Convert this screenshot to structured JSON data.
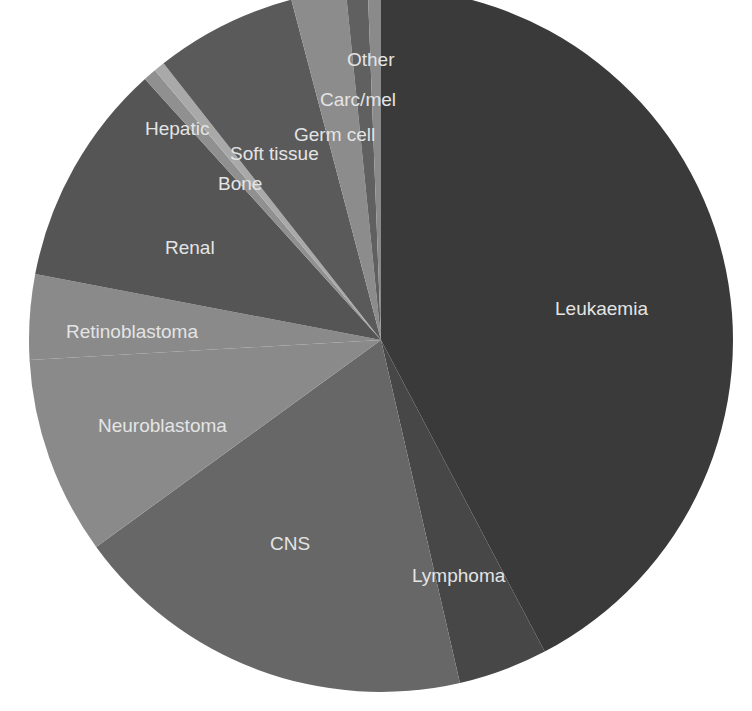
{
  "chart_data": {
    "type": "pie",
    "title": "",
    "start_angle_deg": 0,
    "direction": "clockwise",
    "categories": [
      "Leukaemia",
      "Lymphoma",
      "CNS",
      "Neuroblastoma",
      "Retinoblastoma",
      "Renal",
      "Bone",
      "Hepatic",
      "Soft tissue",
      "Germ cell",
      "Carc/mel",
      "Other"
    ],
    "values": [
      42.3,
      4.1,
      18.6,
      9.1,
      3.9,
      10.3,
      0.6,
      0.5,
      6.5,
      2.5,
      1.0,
      0.6
    ],
    "unit": "% (estimated from slice angles)",
    "colors": [
      "#3a3a3a",
      "#474747",
      "#676767",
      "#8a8a8a",
      "#8a8a8a",
      "#555555",
      "#909090",
      "#a9a9a9",
      "#5a5a5a",
      "#8c8c8c",
      "#606060",
      "#8a8a8a"
    ],
    "labels": [
      {
        "text": "Leukaemia",
        "x": 555,
        "y": 315
      },
      {
        "text": "Lymphoma",
        "x": 412,
        "y": 582
      },
      {
        "text": "CNS",
        "x": 270,
        "y": 550
      },
      {
        "text": "Neuroblastoma",
        "x": 98,
        "y": 432
      },
      {
        "text": "Retinoblastoma",
        "x": 66,
        "y": 338
      },
      {
        "text": "Renal",
        "x": 165,
        "y": 254
      },
      {
        "text": "Bone",
        "x": 218,
        "y": 190
      },
      {
        "text": "Hepatic",
        "x": 145,
        "y": 135
      },
      {
        "text": "Soft tissue",
        "x": 230,
        "y": 160
      },
      {
        "text": "Germ cell",
        "x": 294,
        "y": 141
      },
      {
        "text": "Carc/mel",
        "x": 320,
        "y": 106
      },
      {
        "text": "Other",
        "x": 347,
        "y": 66
      }
    ],
    "legend": "none (labels inside slices)",
    "center": [
      381,
      340
    ],
    "radius": 352
  }
}
